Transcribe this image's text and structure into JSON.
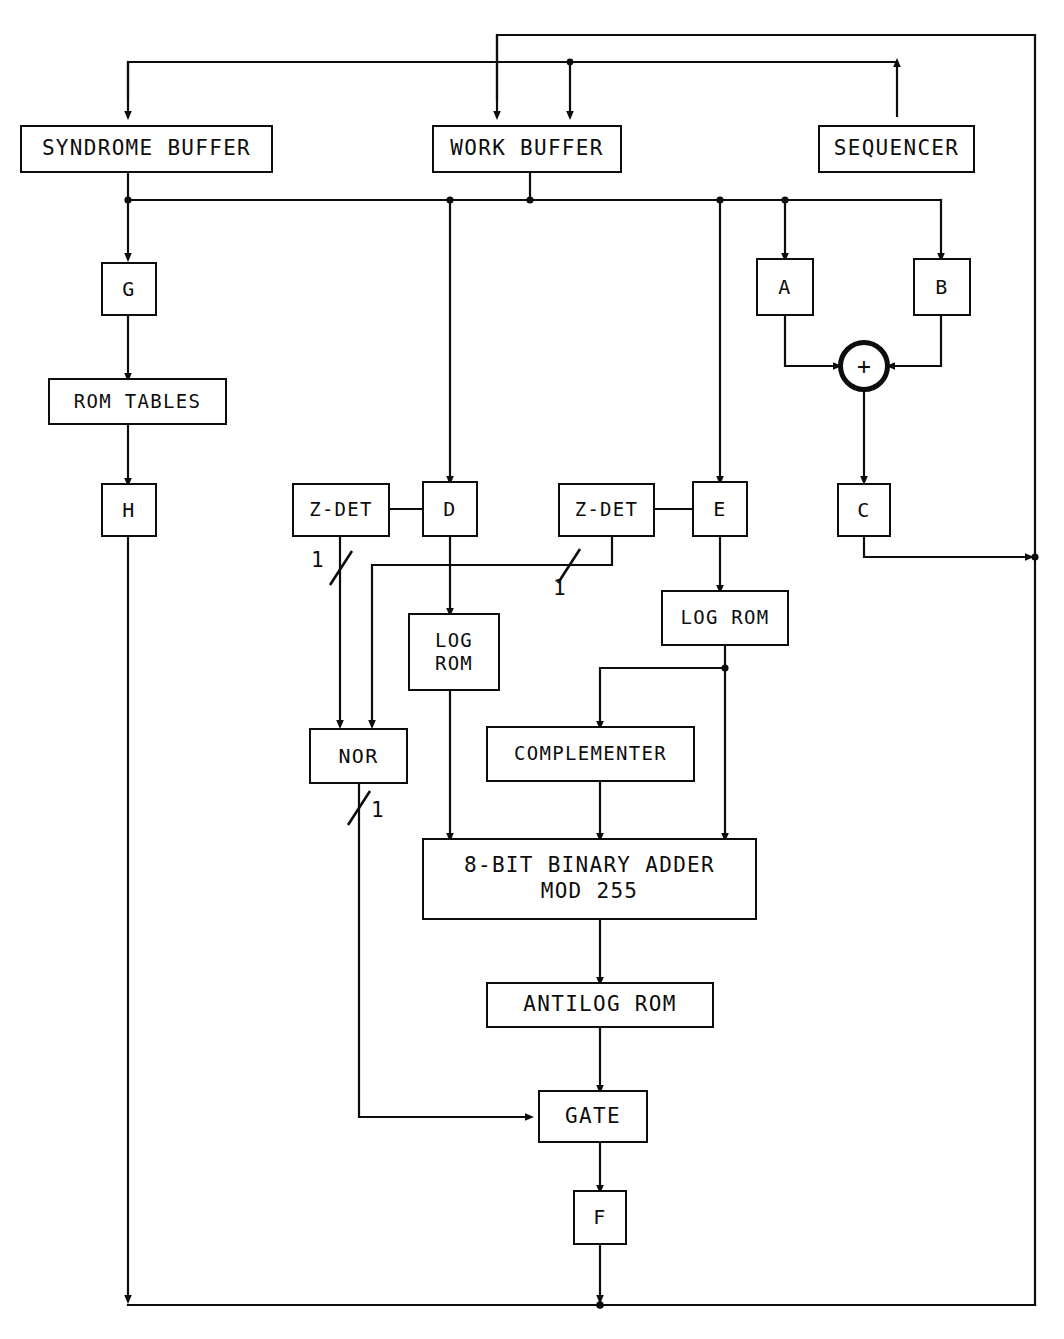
{
  "diagram": {
    "line_color": "#0d0d0d",
    "background": "#ffffff"
  },
  "blocks": {
    "syndrome_buffer": "SYNDROME BUFFER",
    "work_buffer": "WORK BUFFER",
    "sequencer": "SEQUENCER",
    "reg_g": "G",
    "rom_tables": "ROM TABLES",
    "reg_h": "H",
    "reg_a": "A",
    "reg_b": "B",
    "reg_c": "C",
    "reg_d": "D",
    "reg_e": "E",
    "reg_f": "F",
    "zdet_left": "Z-DET",
    "zdet_right": "Z-DET",
    "log_rom_left": "LOG\nROM",
    "log_rom_right": "LOG ROM",
    "nor_gate": "NOR",
    "complementer": "COMPLEMENTER",
    "adder": "8-BIT BINARY ADDER\nMOD 255",
    "antilog_rom": "ANTILOG ROM",
    "gate": "GATE",
    "summing_junction": "+"
  },
  "bus_labels": {
    "zdet_left_width": "1",
    "zdet_right_width": "1",
    "nor_out_width": "1"
  }
}
